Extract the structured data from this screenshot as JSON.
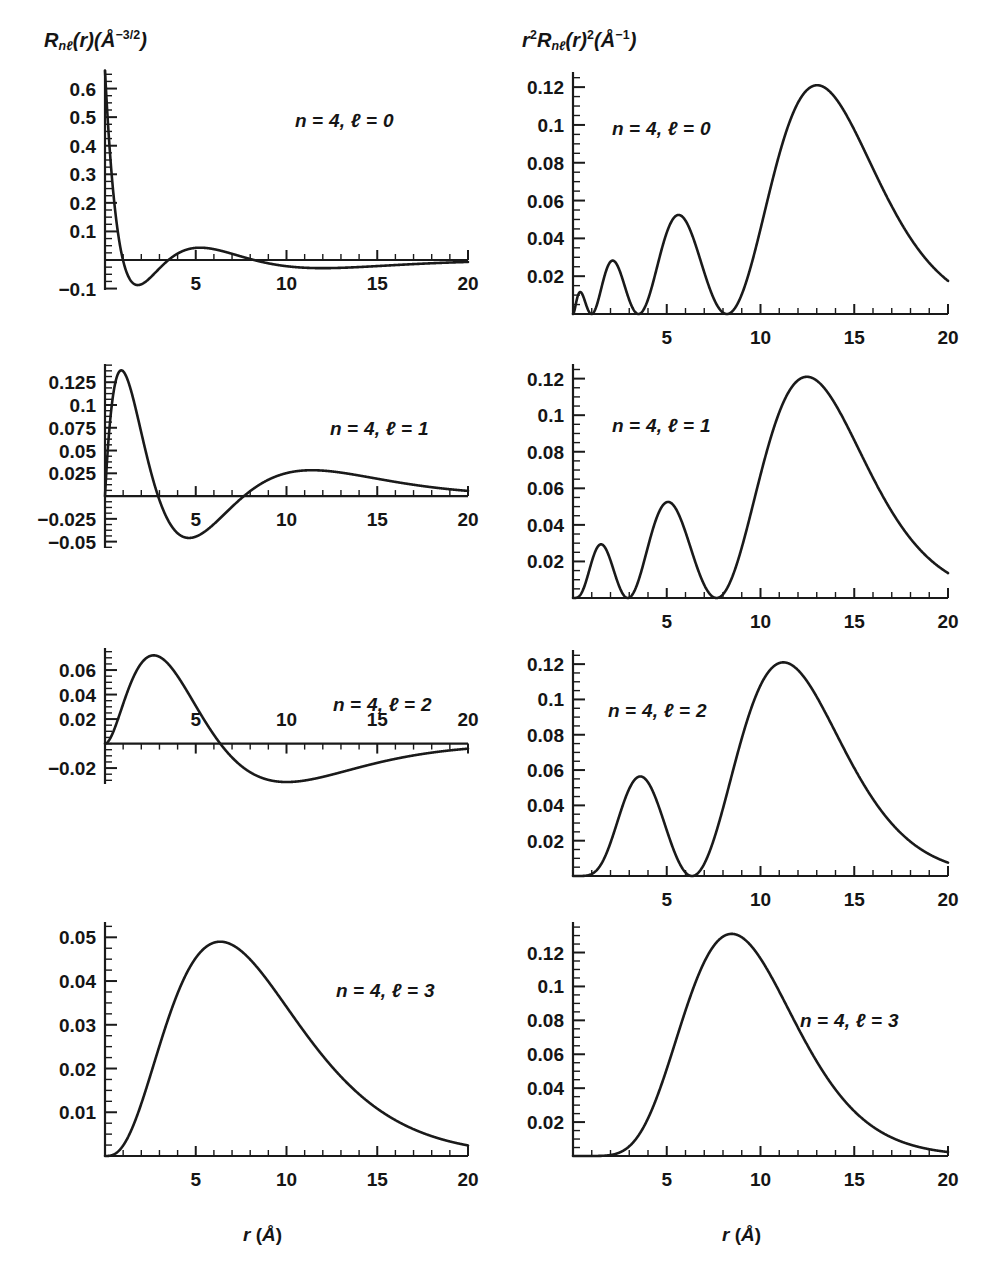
{
  "figure": {
    "columns": [
      {
        "id": "left",
        "axis_label_html": "R<span class=\"sub\">nℓ</span>(r)(Å<sup>−3/2</sup>)",
        "axis_label_text": "Rnℓ(r)(Å−3/2)",
        "xaxis_title_text": "r (Å)"
      },
      {
        "id": "right",
        "axis_label_html": "r<sup>2</sup>R<span class=\"sub\">nℓ</span>(r)<sup>2</sup>(Å<sup>−1</sup>)",
        "axis_label_text": "r2Rnℓ(r)2(Å−1)",
        "xaxis_title_text": "r (Å)"
      }
    ],
    "panel_annotations": [
      "n = 4, ℓ = 0",
      "n = 4, ℓ = 1",
      "n = 4, ℓ = 2",
      "n = 4, ℓ = 3"
    ]
  },
  "chart_data": [
    {
      "id": "R40",
      "type": "line",
      "title": "n = 4, ℓ = 0",
      "xlabel": "r (Å)",
      "ylabel": "R_nℓ(r) (Å^-3/2)",
      "xlim": [
        0,
        20
      ],
      "ylim": [
        -0.1,
        0.66
      ],
      "xticks": [
        5,
        10,
        15,
        20
      ],
      "xticklabels": [
        "5",
        "10",
        "15",
        "20"
      ],
      "xminor_step": 1,
      "yticks": [
        -0.1,
        0.1,
        0.2,
        0.3,
        0.4,
        0.5,
        0.6
      ],
      "yticklabels": [
        "-0.1",
        "0.1",
        "0.2",
        "0.3",
        "0.4",
        "0.5",
        "0.6"
      ],
      "yminor_step": 0.025,
      "grid": false,
      "xlabels_position": "below-axis",
      "function": "hydrogen_R",
      "n": 4,
      "l": 0,
      "a0": 0.529,
      "notes": "Starts at ~0.66 at r=0, falls steeply, minimum about -0.085 near r=2.2, small max ~0.033 near r=5.2, shallow min ~-0.017 near r=11.5, approaches 0 by r=20",
      "key_points": [
        {
          "r": 0.0,
          "y": 0.663
        },
        {
          "r": 0.5,
          "y": 0.325
        },
        {
          "r": 1.0,
          "y": 0.108
        },
        {
          "r": 1.5,
          "y": -0.016
        },
        {
          "r": 2.2,
          "y": -0.085
        },
        {
          "r": 3.0,
          "y": -0.06
        },
        {
          "r": 4.0,
          "y": 0.002
        },
        {
          "r": 5.2,
          "y": 0.033
        },
        {
          "r": 6.5,
          "y": 0.028
        },
        {
          "r": 8.2,
          "y": 0.0
        },
        {
          "r": 11.5,
          "y": -0.017
        },
        {
          "r": 15.0,
          "y": -0.012
        },
        {
          "r": 20.0,
          "y": -0.003
        }
      ]
    },
    {
      "id": "P40",
      "type": "line",
      "title": "n = 4, ℓ = 0",
      "xlabel": "r (Å)",
      "ylabel": "r^2 R_nℓ(r)^2 (Å^-1)",
      "xlim": [
        0,
        20
      ],
      "ylim": [
        0,
        0.128
      ],
      "xticks": [
        5,
        10,
        15,
        20
      ],
      "xticklabels": [
        "5",
        "10",
        "15",
        "20"
      ],
      "xminor_step": 1,
      "yticks": [
        0.02,
        0.04,
        0.06,
        0.08,
        0.1,
        0.12
      ],
      "yticklabels": [
        "0.02",
        "0.04",
        "0.06",
        "0.08",
        "0.1",
        "0.12"
      ],
      "yminor_step": 0.005,
      "grid": false,
      "xlabels_position": "below-axis",
      "function": "hydrogen_P",
      "n": 4,
      "l": 0,
      "a0": 0.529,
      "notes": "Four lobes: ~0.010 at r=0.5, ~0.029 at r=2.4, ~0.052 at r=5.6, ~0.121 at r=13.0; nodes near 1.5, 3.9, 8.2",
      "key_points": [
        {
          "r": 0.5,
          "y": 0.01
        },
        {
          "r": 1.5,
          "y": 0.0
        },
        {
          "r": 2.4,
          "y": 0.029
        },
        {
          "r": 3.9,
          "y": 0.0
        },
        {
          "r": 5.6,
          "y": 0.052
        },
        {
          "r": 8.2,
          "y": 0.0
        },
        {
          "r": 13.0,
          "y": 0.121
        },
        {
          "r": 16.0,
          "y": 0.087
        },
        {
          "r": 20.0,
          "y": 0.017
        }
      ]
    },
    {
      "id": "R41",
      "type": "line",
      "title": "n = 4, ℓ = 1",
      "xlabel": "r (Å)",
      "ylabel": "R_nℓ(r) (Å^-3/2)",
      "xlim": [
        0,
        20
      ],
      "ylim": [
        -0.055,
        0.145
      ],
      "xticks": [
        5,
        10,
        15,
        20
      ],
      "xticklabels": [
        "5",
        "10",
        "15",
        "20"
      ],
      "xminor_step": 1,
      "yticks": [
        -0.05,
        -0.025,
        0.025,
        0.05,
        0.075,
        0.1,
        0.125
      ],
      "yticklabels": [
        "-0.05",
        "-0.025",
        "0.025",
        "0.05",
        "0.075",
        "0.1",
        "0.125"
      ],
      "yminor_step": 0.00625,
      "grid": false,
      "xlabels_position": "below-axis",
      "function": "hydrogen_R",
      "n": 4,
      "l": 1,
      "a0": 0.529,
      "notes": "Rises from 0 to max ~0.138 near r=1.3, crosses zero near r=3.0, min ~-0.048 near r=4.7, crosses zero near 7.6, broad max ~0.030 near r=11.3, decays to ~0.009 at 20",
      "key_points": [
        {
          "r": 0.0,
          "y": 0.0
        },
        {
          "r": 1.3,
          "y": 0.138
        },
        {
          "r": 2.0,
          "y": 0.093
        },
        {
          "r": 3.0,
          "y": 0.0
        },
        {
          "r": 4.7,
          "y": -0.048
        },
        {
          "r": 6.0,
          "y": -0.03
        },
        {
          "r": 7.6,
          "y": 0.0
        },
        {
          "r": 11.3,
          "y": 0.03
        },
        {
          "r": 15.0,
          "y": 0.021
        },
        {
          "r": 20.0,
          "y": 0.009
        }
      ]
    },
    {
      "id": "P41",
      "type": "line",
      "title": "n = 4, ℓ = 1",
      "xlabel": "r (Å)",
      "ylabel": "r^2 R_nℓ(r)^2 (Å^-1)",
      "xlim": [
        0,
        20
      ],
      "ylim": [
        0,
        0.128
      ],
      "xticks": [
        5,
        10,
        15,
        20
      ],
      "xticklabels": [
        "5",
        "10",
        "15",
        "20"
      ],
      "xminor_step": 1,
      "yticks": [
        0.02,
        0.04,
        0.06,
        0.08,
        0.1,
        0.12
      ],
      "yticklabels": [
        "0.02",
        "0.04",
        "0.06",
        "0.08",
        "0.1",
        "0.12"
      ],
      "yminor_step": 0.005,
      "grid": false,
      "xlabels_position": "below-axis",
      "function": "hydrogen_P",
      "n": 4,
      "l": 1,
      "a0": 0.529,
      "notes": "Three lobes: ~0.029 at r=1.6, ~0.052 at r=5.0, ~0.121 at r=12.4; nodes at r=3.0 and r=7.6",
      "key_points": [
        {
          "r": 1.6,
          "y": 0.029
        },
        {
          "r": 3.0,
          "y": 0.0
        },
        {
          "r": 5.0,
          "y": 0.052
        },
        {
          "r": 7.6,
          "y": 0.0
        },
        {
          "r": 12.4,
          "y": 0.121
        },
        {
          "r": 16.0,
          "y": 0.075
        },
        {
          "r": 20.0,
          "y": 0.013
        }
      ]
    },
    {
      "id": "R42",
      "type": "line",
      "title": "n = 4, ℓ = 2",
      "xlabel": "r (Å)",
      "ylabel": "R_nℓ(r) (Å^-3/2)",
      "xlim": [
        0,
        20
      ],
      "ylim": [
        -0.032,
        0.078
      ],
      "xticks": [
        5,
        10,
        15,
        20
      ],
      "xticklabels": [
        "5",
        "10",
        "15",
        "20"
      ],
      "xminor_step": 1,
      "yticks": [
        -0.02,
        0.02,
        0.04,
        0.06
      ],
      "yticklabels": [
        "-0.02",
        "0.02",
        "0.04",
        "0.06"
      ],
      "yminor_step": 0.005,
      "grid": false,
      "xlabels_position": "above-axis",
      "function": "hydrogen_R",
      "n": 4,
      "l": 2,
      "a0": 0.529,
      "notes": "Rises to max ~0.072 near r=3.3, zero crossing near r=6.3, min ~-0.028 near r=10.5, rises back toward ~-0.004 at r=20. X tick labels printed above the axis line.",
      "key_points": [
        {
          "r": 0.0,
          "y": 0.0
        },
        {
          "r": 1.0,
          "y": 0.02
        },
        {
          "r": 3.3,
          "y": 0.072
        },
        {
          "r": 5.0,
          "y": 0.044
        },
        {
          "r": 6.3,
          "y": 0.0
        },
        {
          "r": 8.0,
          "y": -0.02
        },
        {
          "r": 10.5,
          "y": -0.028
        },
        {
          "r": 14.0,
          "y": -0.021
        },
        {
          "r": 17.0,
          "y": -0.012
        },
        {
          "r": 20.0,
          "y": -0.004
        }
      ]
    },
    {
      "id": "P42",
      "type": "line",
      "title": "n = 4, ℓ = 2",
      "xlabel": "r (Å)",
      "ylabel": "r^2 R_nℓ(r)^2 (Å^-1)",
      "xlim": [
        0,
        20
      ],
      "ylim": [
        0,
        0.128
      ],
      "xticks": [
        5,
        10,
        15,
        20
      ],
      "xticklabels": [
        "5",
        "10",
        "15",
        "20"
      ],
      "xminor_step": 1,
      "yticks": [
        0.02,
        0.04,
        0.06,
        0.08,
        0.1,
        0.12
      ],
      "yticklabels": [
        "0.02",
        "0.04",
        "0.06",
        "0.08",
        "0.1",
        "0.12"
      ],
      "yminor_step": 0.005,
      "grid": false,
      "xlabels_position": "below-axis",
      "function": "hydrogen_P",
      "n": 4,
      "l": 2,
      "a0": 0.529,
      "notes": "Two lobes: ~0.056 at r=3.6, ~0.121 at r=11.2; node at r=6.3",
      "key_points": [
        {
          "r": 3.6,
          "y": 0.056
        },
        {
          "r": 6.3,
          "y": 0.0
        },
        {
          "r": 11.2,
          "y": 0.121
        },
        {
          "r": 15.0,
          "y": 0.062
        },
        {
          "r": 20.0,
          "y": 0.007
        }
      ]
    },
    {
      "id": "R43",
      "type": "line",
      "title": "n = 4, ℓ = 3",
      "xlabel": "r (Å)",
      "ylabel": "R_nℓ(r) (Å^-3/2)",
      "xlim": [
        0,
        20
      ],
      "ylim": [
        0,
        0.053
      ],
      "xticks": [
        5,
        10,
        15,
        20
      ],
      "xticklabels": [
        "5",
        "10",
        "15",
        "20"
      ],
      "xminor_step": 1,
      "yticks": [
        0.01,
        0.02,
        0.03,
        0.04,
        0.05
      ],
      "yticklabels": [
        "0.01",
        "0.02",
        "0.03",
        "0.04",
        "0.05"
      ],
      "yminor_step": 0.0025,
      "grid": false,
      "xlabels_position": "below-axis",
      "function": "hydrogen_R",
      "n": 4,
      "l": 3,
      "a0": 0.529,
      "notes": "Nodeless; single broad maximum ~0.049 near r=6.3, decays toward ~0.003 at r=20",
      "key_points": [
        {
          "r": 0.0,
          "y": 0.0
        },
        {
          "r": 2.0,
          "y": 0.011
        },
        {
          "r": 4.0,
          "y": 0.036
        },
        {
          "r": 6.3,
          "y": 0.049
        },
        {
          "r": 8.0,
          "y": 0.045
        },
        {
          "r": 10.0,
          "y": 0.035
        },
        {
          "r": 13.0,
          "y": 0.019
        },
        {
          "r": 16.0,
          "y": 0.009
        },
        {
          "r": 20.0,
          "y": 0.003
        }
      ]
    },
    {
      "id": "P43",
      "type": "line",
      "title": "n = 4, ℓ = 3",
      "xlabel": "r (Å)",
      "ylabel": "r^2 R_nℓ(r)^2 (Å^-1)",
      "xlim": [
        0,
        20
      ],
      "ylim": [
        0,
        0.138
      ],
      "xticks": [
        5,
        10,
        15,
        20
      ],
      "xticklabels": [
        "5",
        "10",
        "15",
        "20"
      ],
      "xminor_step": 1,
      "yticks": [
        0.02,
        0.04,
        0.06,
        0.08,
        0.1,
        0.12
      ],
      "yticklabels": [
        "0.02",
        "0.04",
        "0.06",
        "0.08",
        "0.1",
        "0.12"
      ],
      "yminor_step": 0.005,
      "grid": false,
      "xlabels_position": "below-axis",
      "function": "hydrogen_P",
      "n": 4,
      "l": 3,
      "a0": 0.529,
      "notes": "Single lobe peaking ~0.131 near r=8.4, decays to ~0.004 at r=20",
      "key_points": [
        {
          "r": 2.0,
          "y": 0.0005
        },
        {
          "r": 4.0,
          "y": 0.021
        },
        {
          "r": 6.0,
          "y": 0.084
        },
        {
          "r": 8.4,
          "y": 0.131
        },
        {
          "r": 11.0,
          "y": 0.108
        },
        {
          "r": 14.0,
          "y": 0.055
        },
        {
          "r": 17.0,
          "y": 0.022
        },
        {
          "r": 20.0,
          "y": 0.004
        }
      ]
    }
  ],
  "style": {
    "curve_color": "#1a1a1a",
    "axis_color": "#1a1a1a",
    "text_color": "#151515",
    "background": "#ffffff"
  }
}
